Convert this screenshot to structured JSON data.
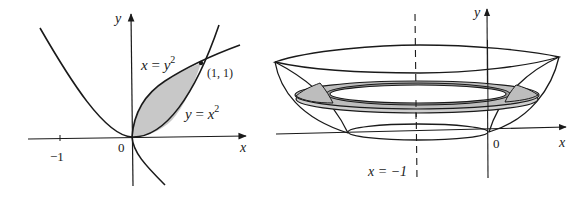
{
  "left_figure": {
    "axis_labels": {
      "x": "x",
      "y": "y"
    },
    "origin_label": "0",
    "tick_labels": [
      "−1"
    ],
    "curve_labels": {
      "upper": {
        "var": "x",
        "eq": " = ",
        "rhs": "y",
        "exp": "2"
      },
      "lower": {
        "var": "y",
        "eq": " = ",
        "rhs": "x",
        "exp": "2"
      }
    },
    "point_label": "(1, 1)",
    "colors": {
      "line": "#1a1a1a",
      "shade": "#c8c8c8"
    }
  },
  "right_figure": {
    "axis_labels": {
      "x": "x",
      "y": "y"
    },
    "origin_label": "0",
    "axis_of_rotation_label": "x = −1",
    "colors": {
      "line": "#1a1a1a",
      "shade": "#bdbdbd"
    }
  }
}
